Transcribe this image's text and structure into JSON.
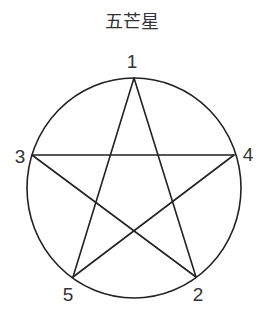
{
  "title": "五芒星",
  "diagram": {
    "type": "pentagram inscribed in circle",
    "colors": {
      "stroke": "#222222",
      "text": "#333333"
    },
    "circle": {
      "cx": 134,
      "cy": 188,
      "rx": 107,
      "ry": 110
    },
    "vertices": [
      {
        "label": "1",
        "x": 134,
        "y": 78,
        "label_x": 132,
        "label_y": 68
      },
      {
        "label": "2",
        "x": 196,
        "y": 277,
        "label_x": 198,
        "label_y": 301
      },
      {
        "label": "3",
        "x": 32,
        "y": 155,
        "label_x": 20,
        "label_y": 163
      },
      {
        "label": "4",
        "x": 234,
        "y": 155,
        "label_x": 248,
        "label_y": 161
      },
      {
        "label": "5",
        "x": 73,
        "y": 277,
        "label_x": 68,
        "label_y": 301
      }
    ],
    "edges": [
      [
        "1",
        "2"
      ],
      [
        "2",
        "3"
      ],
      [
        "3",
        "4"
      ],
      [
        "4",
        "5"
      ],
      [
        "5",
        "1"
      ]
    ]
  }
}
